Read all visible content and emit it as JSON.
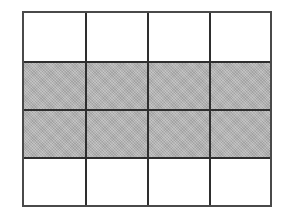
{
  "grid": {
    "rows": 4,
    "columns": 4,
    "border_color": "#2e2e2e",
    "shaded_color": "#b5b5b5",
    "unshaded_color": "#ffffff",
    "cells": [
      [
        "white",
        "white",
        "white",
        "white"
      ],
      [
        "gray",
        "gray",
        "gray",
        "gray"
      ],
      [
        "gray",
        "gray",
        "gray",
        "gray"
      ],
      [
        "white",
        "white",
        "white",
        "white"
      ]
    ],
    "shaded_rows": [
      2,
      3
    ]
  }
}
